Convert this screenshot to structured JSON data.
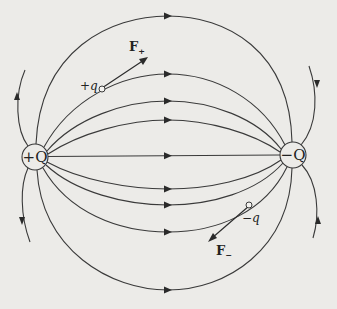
{
  "diagram": {
    "colors": {
      "background": "#ecebe8",
      "line": "#3a3a3a",
      "arrow": "#2a2a2a"
    },
    "charges": [
      {
        "id": "positive-source",
        "label": "+Q",
        "sign": "positive"
      },
      {
        "id": "negative-source",
        "label": "−Q",
        "sign": "negative"
      }
    ],
    "test_charges": [
      {
        "id": "positive-test",
        "label_sign": "+",
        "label_var": "q",
        "force_label": "F",
        "force_sub": "+",
        "force_direction": "along field"
      },
      {
        "id": "negative-test",
        "label_sign": "−",
        "label_var": "q",
        "force_label": "F",
        "force_sub": "−",
        "force_direction": "opposite field"
      }
    ],
    "field_lines": {
      "connecting_count": 9,
      "open_lines_count": 4,
      "direction": "from +Q to −Q"
    }
  }
}
